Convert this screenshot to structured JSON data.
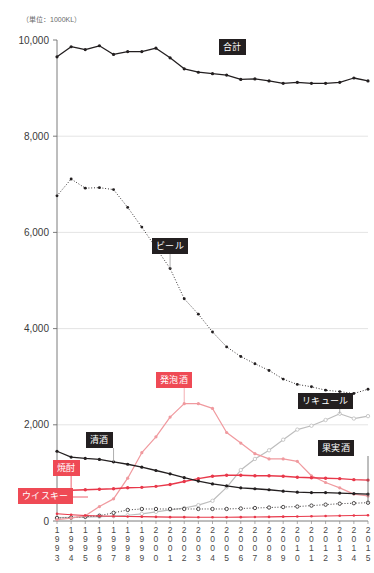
{
  "unit_note": "（単位：1000KL）",
  "axis": {
    "y_ticks": [
      "10,000",
      "8,000",
      "6,000",
      "4,000",
      "2,000",
      "0"
    ],
    "y_min": 0,
    "y_max": 10000,
    "x_years": [
      "1993",
      "1994",
      "1995",
      "1996",
      "1997",
      "1998",
      "1999",
      "2000",
      "2001",
      "2002",
      "2003",
      "2004",
      "2005",
      "2006",
      "2007",
      "2008",
      "2009",
      "2010",
      "2011",
      "2012",
      "2013",
      "2014",
      "2015"
    ]
  },
  "labels": {
    "total": "合計",
    "beer": "ビール",
    "happoshu": "発泡酒",
    "liqueur": "リキュール",
    "sake": "清酒",
    "shochu": "焼酎",
    "whisky": "ウイスキー",
    "fruit_wine": "果実酒"
  },
  "colors": {
    "dark": "#231f20",
    "red": "#e8384a",
    "pink": "#f09a9f",
    "lightpink": "#f4b8bc",
    "gray": "#9a9a9a",
    "badge_red": "#ef4a55",
    "badge_dark": "#231f20",
    "grid": "#d9d9d9"
  },
  "chart_data": {
    "type": "line",
    "title": "",
    "subtitle": "",
    "xlabel": "",
    "ylabel": "（単位：1000KL）",
    "ylim": [
      0,
      10000
    ],
    "xlim": [
      "1993",
      "2015"
    ],
    "grid": true,
    "legend": "inline-labels",
    "x": [
      "1993",
      "1994",
      "1995",
      "1996",
      "1997",
      "1998",
      "1999",
      "2000",
      "2001",
      "2002",
      "2003",
      "2004",
      "2005",
      "2006",
      "2007",
      "2008",
      "2009",
      "2010",
      "2011",
      "2012",
      "2013",
      "2014",
      "2015"
    ],
    "series": [
      {
        "name": "合計",
        "style": "solid-dark-marker",
        "color": "#231f20",
        "values": [
          9650,
          9860,
          9800,
          9880,
          9700,
          9760,
          9760,
          9830,
          9630,
          9400,
          9330,
          9300,
          9270,
          9180,
          9190,
          9150,
          9100,
          9120,
          9100,
          9100,
          9120,
          9210,
          9150
        ]
      },
      {
        "name": "ビール",
        "style": "dotted-dark-marker",
        "color": "#231f20",
        "values": [
          6760,
          7110,
          6920,
          6930,
          6890,
          6520,
          6110,
          5680,
          5250,
          4620,
          4300,
          3930,
          3620,
          3420,
          3270,
          3130,
          2950,
          2840,
          2790,
          2720,
          2690,
          2650,
          2740
        ]
      },
      {
        "name": "発泡酒",
        "style": "solid-pink-marker",
        "color": "#f09a9f",
        "values": [
          30,
          60,
          110,
          300,
          460,
          890,
          1420,
          1750,
          2160,
          2440,
          2440,
          2340,
          1840,
          1620,
          1400,
          1290,
          1290,
          1240,
          940,
          800,
          690,
          560,
          520
        ]
      },
      {
        "name": "リキュール",
        "style": "solid-lightgray-marker",
        "color": "#bdbdbd",
        "values": [
          70,
          75,
          80,
          90,
          100,
          120,
          150,
          190,
          230,
          270,
          330,
          420,
          700,
          1060,
          1290,
          1470,
          1690,
          1900,
          1980,
          2100,
          2230,
          2130,
          2180
        ]
      },
      {
        "name": "清酒",
        "style": "solid-dark-marker",
        "color": "#231f20",
        "values": [
          1450,
          1330,
          1300,
          1280,
          1230,
          1180,
          1120,
          1050,
          980,
          900,
          830,
          770,
          730,
          690,
          670,
          650,
          620,
          600,
          590,
          590,
          580,
          570,
          560
        ]
      },
      {
        "name": "焼酎",
        "style": "solid-red-marker",
        "color": "#e8384a",
        "values": [
          600,
          640,
          650,
          660,
          670,
          690,
          700,
          720,
          760,
          820,
          880,
          930,
          950,
          950,
          940,
          940,
          930,
          910,
          900,
          890,
          880,
          860,
          850
        ]
      },
      {
        "name": "果実酒",
        "style": "dotted-dark-openmarker",
        "color": "#231f20",
        "values": [
          60,
          70,
          90,
          110,
          170,
          230,
          250,
          250,
          250,
          250,
          250,
          250,
          250,
          260,
          270,
          280,
          290,
          300,
          320,
          340,
          360,
          370,
          380
        ]
      },
      {
        "name": "ウイスキー",
        "style": "solid-red-small",
        "color": "#e8384a",
        "values": [
          150,
          130,
          115,
          105,
          100,
          95,
          90,
          85,
          80,
          80,
          78,
          78,
          78,
          80,
          82,
          85,
          90,
          95,
          100,
          105,
          110,
          115,
          120
        ]
      }
    ]
  }
}
